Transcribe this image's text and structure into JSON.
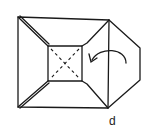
{
  "diagram": {
    "type": "origami-step",
    "step_label": "d",
    "stroke_color": "#1a1a1a",
    "background": "#ffffff",
    "elements": {
      "outer_frame": "rectangle with raised edges",
      "inner_square": "central flat square",
      "crease": "dashed X (valley folds)",
      "side_flap": "pentagonal flap on right",
      "arrow": "curved arrow indicating fold-over to the left"
    }
  }
}
